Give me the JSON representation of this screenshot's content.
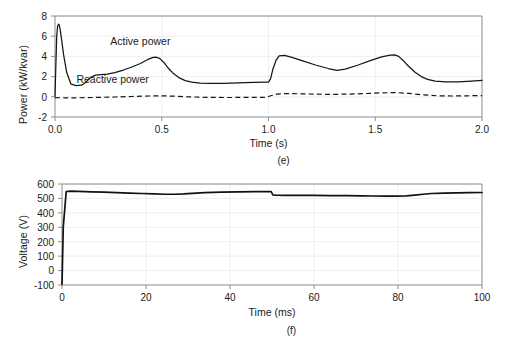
{
  "figure": {
    "background": "#ffffff",
    "line_color": "#161616",
    "frame_color": "#8c8c8c",
    "grid_color": "#e8e8e8"
  },
  "chart_data": [
    {
      "type": "line",
      "panel_label": "(e)",
      "title": "",
      "xlabel": "Time (s)",
      "ylabel": "Power (kW/kvar)",
      "xlim": [
        0.0,
        2.0
      ],
      "ylim": [
        -2,
        8
      ],
      "xticks": [
        0.0,
        0.5,
        1.0,
        1.5,
        2.0
      ],
      "xticklabels": [
        "0.0",
        "0.5",
        "1.0",
        "1.5",
        "2.0"
      ],
      "yticks": [
        -2,
        0,
        2,
        4,
        6,
        8
      ],
      "yticklabels": [
        "-2",
        "0",
        "2",
        "4",
        "6",
        "8"
      ],
      "grid": true,
      "legend": "inline-annotations",
      "annotations": [
        {
          "text": "Active power",
          "x": 0.4,
          "y": 5.1
        },
        {
          "text": "Reactive power",
          "x": 0.27,
          "y": 1.35
        }
      ],
      "series": [
        {
          "name": "Active power",
          "style": "solid",
          "x": [
            0.0,
            0.004,
            0.008,
            0.012,
            0.016,
            0.02,
            0.024,
            0.03,
            0.04,
            0.055,
            0.075,
            0.1,
            0.125,
            0.145,
            0.165,
            0.19,
            0.215,
            0.245,
            0.28,
            0.32,
            0.36,
            0.4,
            0.435,
            0.46,
            0.475,
            0.49,
            0.51,
            0.53,
            0.555,
            0.58,
            0.61,
            0.64,
            0.68,
            0.73,
            0.79,
            0.86,
            0.93,
            0.985,
            1.0,
            1.01,
            1.02,
            1.035,
            1.05,
            1.075,
            1.11,
            1.16,
            1.22,
            1.28,
            1.32,
            1.36,
            1.42,
            1.48,
            1.53,
            1.57,
            1.59,
            1.61,
            1.63,
            1.655,
            1.685,
            1.715,
            1.745,
            1.78,
            1.83,
            1.89,
            1.95,
            2.0
          ],
          "y": [
            0.05,
            3.1,
            6.0,
            6.95,
            7.2,
            7.1,
            6.7,
            5.8,
            4.2,
            2.4,
            1.25,
            1.1,
            1.15,
            1.45,
            1.9,
            2.15,
            2.2,
            2.25,
            2.4,
            2.65,
            2.95,
            3.3,
            3.7,
            3.9,
            3.92,
            3.8,
            3.4,
            2.85,
            2.3,
            1.9,
            1.6,
            1.45,
            1.35,
            1.32,
            1.34,
            1.38,
            1.42,
            1.45,
            1.46,
            1.8,
            2.7,
            3.6,
            4.05,
            4.1,
            3.9,
            3.55,
            3.15,
            2.8,
            2.62,
            2.75,
            3.15,
            3.6,
            3.95,
            4.12,
            4.15,
            4.0,
            3.6,
            3.05,
            2.45,
            2.0,
            1.72,
            1.55,
            1.48,
            1.48,
            1.55,
            1.62
          ]
        },
        {
          "name": "Reactive power",
          "style": "dashed",
          "x": [
            0.0,
            0.03,
            0.08,
            0.14,
            0.2,
            0.28,
            0.36,
            0.44,
            0.5,
            0.56,
            0.62,
            0.7,
            0.8,
            0.9,
            0.99,
            1.01,
            1.04,
            1.08,
            1.14,
            1.22,
            1.3,
            1.38,
            1.45,
            1.52,
            1.57,
            1.61,
            1.66,
            1.72,
            1.79,
            1.86,
            1.93,
            2.0
          ],
          "y": [
            -0.08,
            -0.1,
            -0.1,
            -0.09,
            -0.06,
            -0.02,
            0.03,
            0.08,
            0.1,
            0.06,
            0.0,
            -0.05,
            -0.07,
            -0.06,
            -0.05,
            0.1,
            0.26,
            0.32,
            0.3,
            0.26,
            0.24,
            0.27,
            0.32,
            0.38,
            0.41,
            0.4,
            0.33,
            0.2,
            0.1,
            0.08,
            0.1,
            0.12
          ]
        }
      ]
    },
    {
      "type": "line",
      "panel_label": "(f)",
      "title": "",
      "xlabel": "Time (ms)",
      "ylabel": "Voltage (V)",
      "xlim": [
        0,
        100
      ],
      "ylim": [
        -100,
        600
      ],
      "xticks": [
        0,
        20,
        40,
        60,
        80,
        100
      ],
      "xticklabels": [
        "0",
        "20",
        "40",
        "60",
        "80",
        "100"
      ],
      "yticks": [
        -100,
        0,
        100,
        200,
        300,
        400,
        500,
        600
      ],
      "yticklabels": [
        "-100",
        "0",
        "100",
        "200",
        "300",
        "400",
        "500",
        "600"
      ],
      "grid": true,
      "legend": "none",
      "annotations": [],
      "series": [
        {
          "name": "Voltage",
          "style": "solid-thick",
          "x": [
            0.0,
            0.3,
            1.0,
            2.0,
            4.0,
            7.0,
            10.0,
            13.0,
            16.0,
            19.0,
            22.0,
            24.5,
            27.0,
            29.0,
            31.0,
            34.0,
            38.0,
            42.0,
            46.0,
            49.0,
            49.8,
            50.2,
            51.0,
            53.0,
            56.0,
            60.0,
            64.0,
            68.0,
            71.0,
            74.0,
            77.0,
            79.5,
            82.0,
            84.0,
            86.0,
            88.0,
            91.0,
            94.0,
            97.0,
            100.0
          ],
          "y": [
            -95,
            300,
            548,
            551,
            549,
            546,
            543,
            540,
            537,
            534,
            531,
            529,
            529,
            531,
            535,
            540,
            544,
            546,
            547,
            547,
            547,
            525,
            522,
            521,
            521,
            521,
            520,
            519,
            518,
            517,
            516,
            516,
            518,
            523,
            529,
            534,
            537,
            539,
            540,
            541
          ]
        }
      ]
    }
  ]
}
